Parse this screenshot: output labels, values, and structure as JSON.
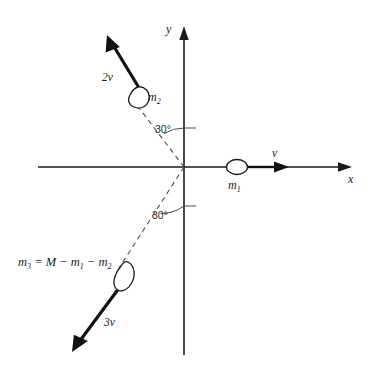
{
  "figure": {
    "kind": "vector-diagram",
    "background_color": "#ffffff",
    "ink_color": "#1a1a1a"
  },
  "axes": {
    "x_label": "x",
    "y_label": "y",
    "origin": {
      "x": 184,
      "y": 167
    },
    "x_start": {
      "x": 38,
      "y": 167
    },
    "x_end": {
      "x": 352,
      "y": 167
    },
    "y_start": {
      "x": 184,
      "y": 355
    },
    "y_end": {
      "x": 184,
      "y": 26
    }
  },
  "vectors": [
    {
      "id": "v1",
      "label": "v",
      "mass_label": "m",
      "mass_subscript": "1",
      "direction": "right",
      "magnitude_text": "v",
      "tail": {
        "x": 246,
        "y": 167
      },
      "tip": {
        "x": 288,
        "y": 167
      },
      "label_pos": {
        "x": 277,
        "y": 156
      },
      "mass_pos": {
        "x": 231,
        "y": 186
      },
      "mass_center": {
        "x": 237,
        "y": 167
      }
    },
    {
      "id": "v2",
      "label": "2v",
      "mass_label": "m",
      "mass_subscript": "2",
      "direction": "up-left, 30 degrees from +y axis",
      "magnitude_text": "2v",
      "tail": {
        "x": 147,
        "y": 100
      },
      "tip": {
        "x": 107,
        "y": 35
      },
      "label_pos": {
        "x": 104,
        "y": 78
      },
      "mass_pos": {
        "x": 148,
        "y": 99
      },
      "mass_center": {
        "x": 137,
        "y": 96
      }
    },
    {
      "id": "v3",
      "label": "3v",
      "mass_label": "m",
      "mass_subscript": "3",
      "direction": "down-left, 30 degrees from -y axis",
      "magnitude_text": "3v",
      "tail": {
        "x": 126,
        "y": 281
      },
      "tip": {
        "x": 72,
        "y": 352
      },
      "label_pos": {
        "x": 108,
        "y": 322
      },
      "mass_center": {
        "x": 123,
        "y": 276
      }
    }
  ],
  "angles": [
    {
      "id": "angle-upper",
      "text": "30°",
      "label_pos": {
        "x": 155,
        "y": 134
      }
    },
    {
      "id": "angle-lower",
      "text": "30°",
      "label_pos": {
        "x": 155,
        "y": 216
      }
    }
  ],
  "equation": {
    "text": "m3 = M − m1 − m2",
    "parts": {
      "lhs_symbol": "m",
      "lhs_sub": "3",
      "equals": "=",
      "total": "M",
      "minus": "−",
      "term1_symbol": "m",
      "term1_sub": "1",
      "term2_symbol": "m",
      "term2_sub": "2"
    },
    "pos": {
      "x": 18,
      "y": 262
    }
  }
}
